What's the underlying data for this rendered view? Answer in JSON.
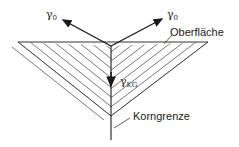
{
  "diagram": {
    "labels": {
      "gamma_left": {
        "symbol": "γ",
        "subscript": "0"
      },
      "gamma_right": {
        "symbol": "γ",
        "subscript": "0"
      },
      "gamma_kg": {
        "symbol": "γ",
        "subscript": "KG"
      },
      "surface": "Oberfläche",
      "grain_boundary": "Korngrenze"
    },
    "colors": {
      "line": "#1a1a1a",
      "hatch": "#555555",
      "background": "#ffffff"
    }
  }
}
